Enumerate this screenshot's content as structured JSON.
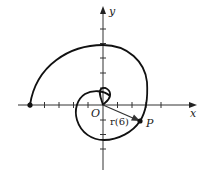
{
  "diagram": {
    "axes": {
      "x_label": "x",
      "y_label": "y",
      "origin_label": "O",
      "tick_spacing_units": 1,
      "x_ticks": [
        -5,
        -4,
        -3,
        -2,
        -1,
        1,
        2,
        3,
        4
      ],
      "y_ticks": [
        -3,
        -2,
        -1,
        1,
        2,
        3,
        4,
        5
      ]
    },
    "curve": {
      "description": "spiral-shaped parametric curve starting at origin, looping around and ending at point on negative x-axis",
      "start_point": [
        0,
        0
      ],
      "end_point": [
        -5,
        0
      ],
      "end_marker": "dot"
    },
    "point": {
      "label": "P",
      "approx_coords": [
        2.6,
        -1.1
      ]
    },
    "vector": {
      "label": "r(6)",
      "from": "O",
      "to": "P"
    },
    "colors": {
      "stroke": "#111111",
      "background": "#ffffff"
    }
  }
}
